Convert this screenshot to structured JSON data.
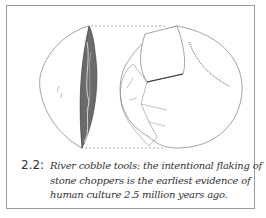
{
  "figure": {
    "number": "2.2:",
    "caption_lines": [
      "River cobble tools: the intentional flaking of",
      "stone choppers is the earliest evidence of",
      "human culture 2.5 million years ago."
    ],
    "illustration": "stone-chopper-drawing",
    "colors": {
      "frame": "#9a9a9a",
      "ink": "#333333",
      "shading": "#555555"
    }
  }
}
